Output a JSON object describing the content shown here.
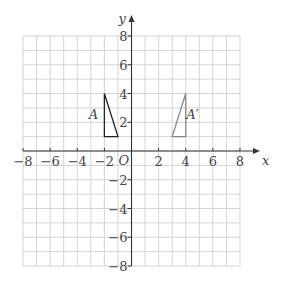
{
  "axes": {
    "x_label": "x",
    "y_label": "y",
    "origin_label": "O",
    "x_range": [
      -8,
      8
    ],
    "y_range": [
      -8,
      8
    ],
    "x_tick_labels": [
      "−8",
      "−6",
      "−4",
      "−2",
      "2",
      "4",
      "6",
      "8"
    ],
    "x_tick_values": [
      -8,
      -6,
      -4,
      -2,
      2,
      4,
      6,
      8
    ],
    "y_tick_labels": [
      "8",
      "6",
      "4",
      "2",
      "−2",
      "−4",
      "−6",
      "−8"
    ],
    "y_tick_values": [
      8,
      6,
      4,
      2,
      -2,
      -4,
      -6,
      -8
    ]
  },
  "grid": {
    "step": 1,
    "color": "#d4d4d4"
  },
  "shapes": [
    {
      "name": "A",
      "label": "A",
      "vertices": [
        [
          -2,
          1
        ],
        [
          -1,
          1
        ],
        [
          -2,
          4
        ]
      ],
      "color": "#222222",
      "label_pos": [
        -2.8,
        2.6
      ]
    },
    {
      "name": "A-prime",
      "label": "A′",
      "vertices": [
        [
          3,
          1
        ],
        [
          4,
          1
        ],
        [
          4,
          4
        ]
      ],
      "color": "#888888",
      "label_pos": [
        4.5,
        2.6
      ]
    }
  ],
  "colors": {
    "axis": "#333333",
    "text": "#444444"
  }
}
